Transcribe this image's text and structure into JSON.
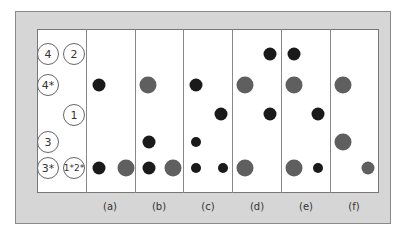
{
  "colors": {
    "black_dot": "#1a1a1a",
    "gray_dot": "#5f5f5f",
    "frame": "#d6d6d6"
  },
  "row_labels": [
    {
      "text": "4",
      "x": 48,
      "y": 54
    },
    {
      "text": "2",
      "x": 74,
      "y": 54
    },
    {
      "text": "4*",
      "x": 48,
      "y": 85
    },
    {
      "text": "1",
      "x": 74,
      "y": 115
    },
    {
      "text": "3",
      "x": 48,
      "y": 142
    },
    {
      "text": "3*",
      "x": 48,
      "y": 168
    },
    {
      "text": "1*2*",
      "x": 74,
      "y": 168
    }
  ],
  "columns": [
    {
      "label": "(a)",
      "x": 110
    },
    {
      "label": "(b)",
      "x": 159
    },
    {
      "label": "(c)",
      "x": 208
    },
    {
      "label": "(d)",
      "x": 257
    },
    {
      "label": "(e)",
      "x": 306
    },
    {
      "label": "(f)",
      "x": 354
    }
  ],
  "dividers": [
    86,
    135,
    183,
    232,
    281,
    330
  ],
  "dots": [
    {
      "col": "a",
      "x": 99,
      "y": 85,
      "color": "black",
      "size": 13
    },
    {
      "col": "a",
      "x": 99,
      "y": 168,
      "color": "black",
      "size": 13
    },
    {
      "col": "a",
      "x": 126,
      "y": 168,
      "color": "gray",
      "size": 17
    },
    {
      "col": "b",
      "x": 148,
      "y": 85,
      "color": "gray",
      "size": 17
    },
    {
      "col": "b",
      "x": 149,
      "y": 142,
      "color": "black",
      "size": 13
    },
    {
      "col": "b",
      "x": 149,
      "y": 168,
      "color": "black",
      "size": 13
    },
    {
      "col": "b",
      "x": 173,
      "y": 168,
      "color": "gray",
      "size": 17
    },
    {
      "col": "c",
      "x": 196,
      "y": 85,
      "color": "black",
      "size": 13
    },
    {
      "col": "c",
      "x": 221,
      "y": 114,
      "color": "black",
      "size": 13
    },
    {
      "col": "c",
      "x": 196,
      "y": 142,
      "color": "black",
      "size": 10
    },
    {
      "col": "c",
      "x": 196,
      "y": 168,
      "color": "black",
      "size": 10
    },
    {
      "col": "c",
      "x": 223,
      "y": 168,
      "color": "black",
      "size": 10
    },
    {
      "col": "d",
      "x": 270,
      "y": 54,
      "color": "black",
      "size": 13
    },
    {
      "col": "d",
      "x": 245,
      "y": 85,
      "color": "gray",
      "size": 17
    },
    {
      "col": "d",
      "x": 270,
      "y": 114,
      "color": "black",
      "size": 13
    },
    {
      "col": "d",
      "x": 245,
      "y": 168,
      "color": "gray",
      "size": 17
    },
    {
      "col": "e",
      "x": 294,
      "y": 54,
      "color": "black",
      "size": 13
    },
    {
      "col": "e",
      "x": 294,
      "y": 85,
      "color": "gray",
      "size": 17
    },
    {
      "col": "e",
      "x": 318,
      "y": 114,
      "color": "black",
      "size": 13
    },
    {
      "col": "e",
      "x": 294,
      "y": 168,
      "color": "gray",
      "size": 17
    },
    {
      "col": "e",
      "x": 318,
      "y": 168,
      "color": "black",
      "size": 10
    },
    {
      "col": "f",
      "x": 343,
      "y": 85,
      "color": "gray",
      "size": 17
    },
    {
      "col": "f",
      "x": 343,
      "y": 142,
      "color": "gray",
      "size": 17
    },
    {
      "col": "f",
      "x": 368,
      "y": 168,
      "color": "gray",
      "size": 13
    }
  ]
}
